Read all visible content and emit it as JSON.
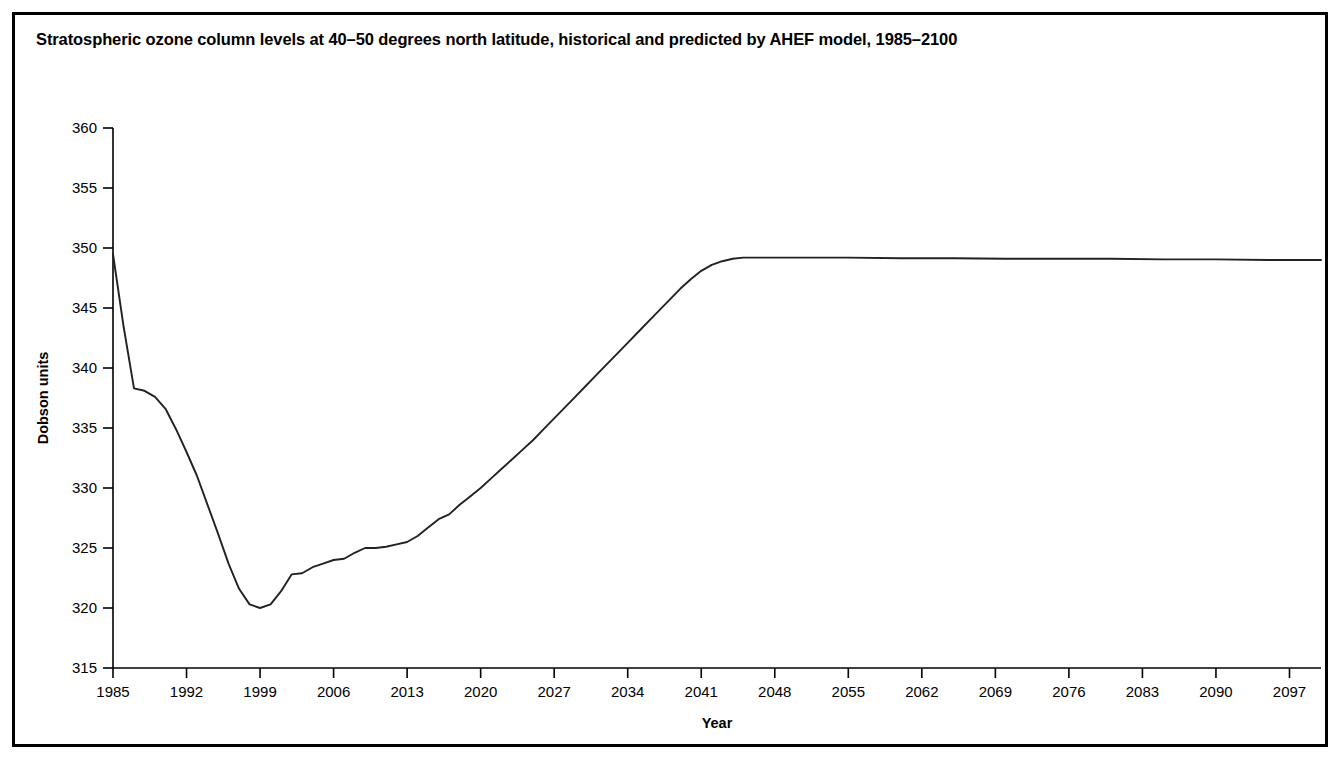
{
  "figure": {
    "title": "Stratospheric ozone column levels at 40–50 degrees north latitude, historical and predicted by AHEF model, 1985–2100",
    "border_color": "#000000",
    "background_color": "#ffffff"
  },
  "chart_data": {
    "type": "line",
    "title": "Stratospheric ozone column levels at 40–50 degrees north latitude, historical and predicted by AHEF model, 1985–2100",
    "xlabel": "Year",
    "ylabel": "Dobson units",
    "xlim": [
      1985,
      2100
    ],
    "ylim": [
      315,
      360
    ],
    "grid": false,
    "legend": "none",
    "line_color": "#222222",
    "xticks": [
      1985,
      1992,
      1999,
      2006,
      2013,
      2020,
      2027,
      2034,
      2041,
      2048,
      2055,
      2062,
      2069,
      2076,
      2083,
      2090,
      2097
    ],
    "xtick_labels": [
      "1985",
      "1992",
      "1999",
      "2006",
      "2013",
      "2020",
      "2027",
      "2034",
      "2041",
      "2048",
      "2055",
      "2062",
      "2069",
      "2076",
      "2083",
      "2090",
      "2097"
    ],
    "yticks": [
      315,
      320,
      325,
      330,
      335,
      340,
      345,
      350,
      355,
      360
    ],
    "ytick_labels": [
      "315",
      "320",
      "325",
      "330",
      "335",
      "340",
      "345",
      "350",
      "355",
      "360"
    ],
    "series": [
      {
        "name": "Stratospheric ozone column (AHEF model)",
        "x": [
          1985,
          1986,
          1987,
          1988,
          1989,
          1990,
          1991,
          1992,
          1993,
          1994,
          1995,
          1996,
          1997,
          1998,
          1999,
          2000,
          2001,
          2002,
          2003,
          2004,
          2005,
          2006,
          2007,
          2008,
          2009,
          2010,
          2011,
          2012,
          2013,
          2014,
          2015,
          2016,
          2017,
          2018,
          2019,
          2020,
          2021,
          2022,
          2023,
          2024,
          2025,
          2026,
          2027,
          2028,
          2029,
          2030,
          2031,
          2032,
          2033,
          2034,
          2035,
          2036,
          2037,
          2038,
          2039,
          2040,
          2041,
          2042,
          2043,
          2044,
          2045,
          2050,
          2055,
          2060,
          2065,
          2070,
          2075,
          2080,
          2085,
          2090,
          2095,
          2100
        ],
        "y": [
          349.5,
          343.5,
          338.3,
          338.1,
          337.6,
          336.6,
          334.9,
          333.0,
          331.0,
          328.6,
          326.2,
          323.7,
          321.6,
          320.3,
          320.0,
          320.3,
          321.4,
          322.8,
          322.9,
          323.4,
          323.7,
          324.0,
          324.1,
          324.6,
          325.0,
          325.0,
          325.1,
          325.3,
          325.5,
          326.0,
          326.7,
          327.4,
          327.8,
          328.6,
          329.3,
          330.0,
          330.8,
          331.6,
          332.4,
          333.2,
          334.0,
          334.9,
          335.8,
          336.7,
          337.6,
          338.5,
          339.4,
          340.3,
          341.2,
          342.1,
          343.0,
          343.9,
          344.8,
          345.7,
          346.6,
          347.4,
          348.1,
          348.6,
          348.9,
          349.1,
          349.2,
          349.2,
          349.2,
          349.15,
          349.15,
          349.1,
          349.1,
          349.1,
          349.05,
          349.05,
          349.0,
          349.0
        ],
        "notable_points": {
          "start_1985": 349.5,
          "minimum_year": 1999,
          "minimum_value": 320.0,
          "recovery_plateau_year": 2045,
          "plateau_value": 349.2,
          "end_2100": 349.0
        }
      }
    ]
  }
}
